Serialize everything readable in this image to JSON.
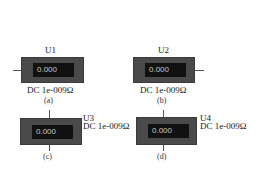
{
  "meters": [
    {
      "id": "U1",
      "reading": "0.000",
      "spec": "DC 1e-009Ω",
      "caption": "(a)",
      "terminal": "left"
    },
    {
      "id": "U2",
      "reading": "0.000",
      "spec": "DC 1e-009Ω",
      "caption": "(b)",
      "terminal": "right"
    },
    {
      "id": "U3",
      "reading": "0.000",
      "spec": "DC 1e-009Ω",
      "caption": "(c)",
      "terminal": "top-bottom"
    },
    {
      "id": "U4",
      "reading": "0.000",
      "spec": "DC 1e-009Ω",
      "caption": "(d)",
      "terminal": "top-bottom"
    }
  ],
  "colors": {
    "meter_body": "#4a4a4a",
    "display_bg": "#111111",
    "display_text": "#c8c8c8",
    "wire": "#555555"
  }
}
